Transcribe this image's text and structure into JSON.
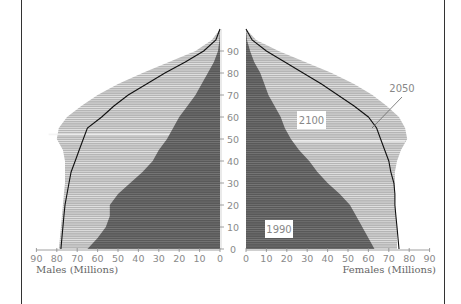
{
  "chart_data": {
    "type": "bar",
    "subtype": "population-pyramid",
    "title": "",
    "xlabel_left": "Males (Millions)",
    "xlabel_right": "Females (Millions)",
    "ylabel": "Age",
    "x_ticks": [
      0,
      10,
      20,
      30,
      40,
      50,
      60,
      70,
      80,
      90
    ],
    "y_ticks": [
      0,
      10,
      20,
      30,
      40,
      50,
      60,
      70,
      80,
      90
    ],
    "xlim": [
      0,
      90
    ],
    "ylim": [
      0,
      100
    ],
    "grid": false,
    "ages": [
      0,
      5,
      10,
      15,
      20,
      25,
      30,
      35,
      40,
      45,
      50,
      55,
      60,
      65,
      70,
      75,
      80,
      85,
      90,
      95,
      100
    ],
    "series": [
      {
        "name": "2100",
        "style": "light-grey-fill",
        "males": [
          79,
          78.5,
          78,
          77.5,
          77,
          76.5,
          76,
          76,
          76,
          77,
          80,
          79,
          75,
          68,
          60,
          50,
          38,
          25,
          12,
          4,
          0
        ],
        "females": [
          74,
          74,
          74,
          73.5,
          73,
          73,
          73,
          73,
          74,
          76,
          79,
          78,
          75,
          69,
          62,
          53,
          42,
          29,
          16,
          5,
          0
        ]
      },
      {
        "name": "2050",
        "style": "black-line",
        "males": [
          78,
          77.5,
          77,
          76.5,
          76,
          75,
          74,
          73,
          71,
          69,
          67,
          65,
          58,
          52,
          45,
          36,
          27,
          17,
          8,
          2,
          0
        ],
        "females": [
          75,
          74.5,
          74,
          73.5,
          73,
          73,
          72.5,
          71,
          70,
          68,
          66,
          64,
          60,
          53,
          45,
          37,
          28,
          19,
          10,
          3,
          0
        ]
      },
      {
        "name": "1990",
        "style": "dark-grey-fill",
        "males": [
          65,
          60,
          56,
          54,
          54,
          50,
          44,
          38,
          33,
          30,
          26,
          23,
          20,
          16,
          12,
          9,
          6,
          3,
          1,
          0.3,
          0
        ],
        "females": [
          63,
          60,
          57,
          54,
          51,
          46,
          40,
          35,
          31,
          26,
          22,
          19,
          17,
          14,
          11,
          9,
          7,
          4,
          2,
          0.5,
          0
        ]
      }
    ],
    "annotations": [
      {
        "text": "2100",
        "boxed": true,
        "side": "female",
        "age": 60,
        "x": 25
      },
      {
        "text": "2050",
        "boxed": false,
        "side": "female",
        "age": 73,
        "x": 76,
        "leader_to": {
          "age": 55,
          "x": 62
        }
      },
      {
        "text": "1990",
        "boxed": true,
        "side": "female",
        "age": 8,
        "x": 12
      }
    ],
    "colors": {
      "series_2100": "#a8a8a8",
      "series_1990": "#5a5a5a",
      "series_2050_line": "#111111",
      "axis": "#888888",
      "label_text": "#8a8a8a"
    }
  },
  "labels": {
    "males_axis": "Males (Millions)",
    "females_axis": "Females (Millions)",
    "label_2100": "2100",
    "label_2050": "2050",
    "label_1990": "1990"
  }
}
